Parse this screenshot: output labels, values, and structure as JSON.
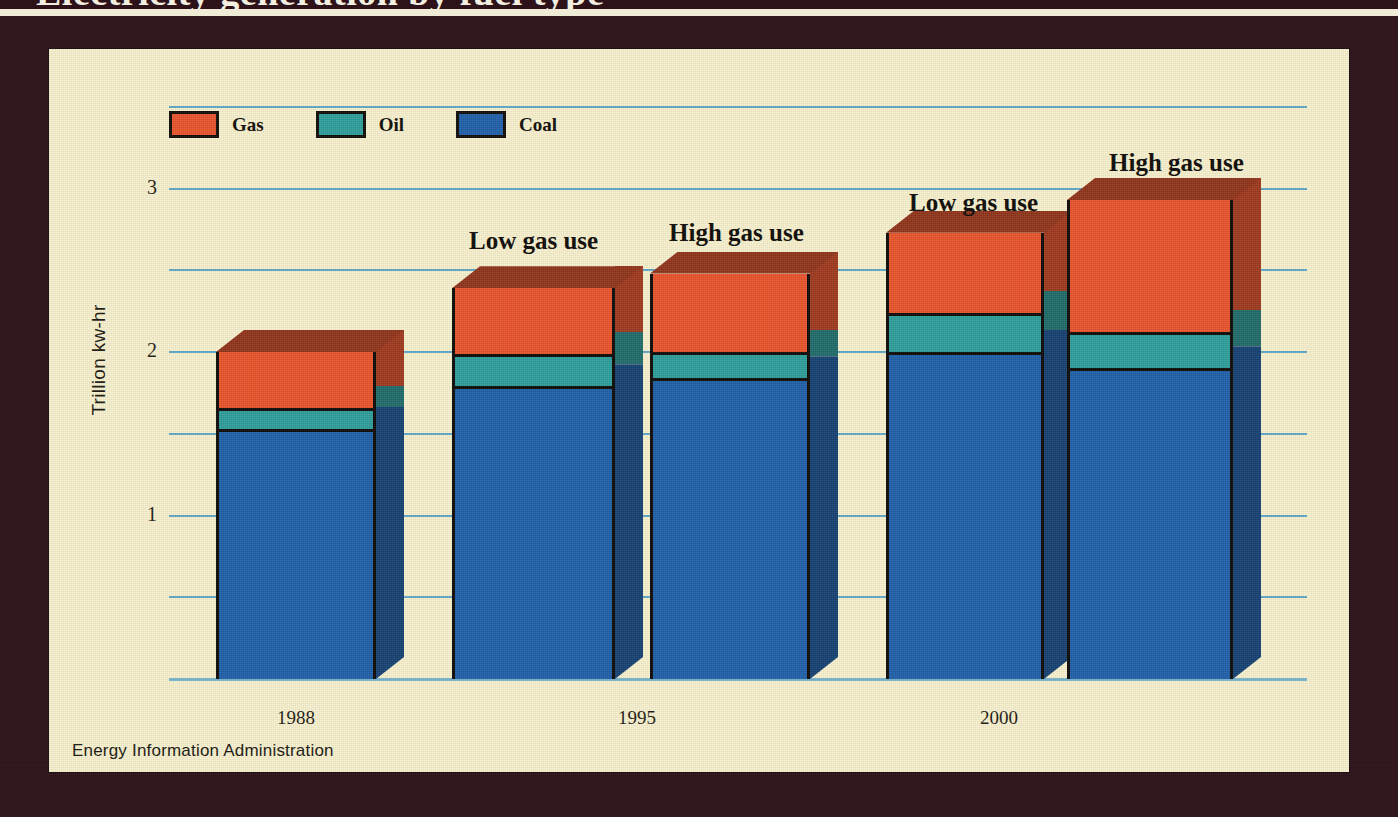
{
  "poster": {
    "title": "Electricity generation by fuel type",
    "frame_color": "#2e1219",
    "panel_color": "#f7f1cd"
  },
  "legend": {
    "items": [
      {
        "label": "Gas",
        "color": "#e8542c"
      },
      {
        "label": "Oil",
        "color": "#2e9e9a"
      },
      {
        "label": "Coal",
        "color": "#1f5fa8"
      }
    ]
  },
  "axes": {
    "ylabel": "Trillion kw-hr",
    "yticks": [
      "3",
      "2",
      "1"
    ],
    "ytick_values": [
      3,
      2,
      1
    ],
    "gridline_values": [
      3.5,
      3,
      2.5,
      2,
      1.5,
      1,
      0.5,
      0
    ],
    "xticks": [
      "1988",
      "1995",
      "2000"
    ]
  },
  "annotations": {
    "low_gas": "Low gas use",
    "high_gas": "High gas use"
  },
  "source": "Energy Information Administration",
  "chart_data": {
    "type": "bar",
    "title": "Electricity generation by fuel type",
    "subtitle": "",
    "stacked": true,
    "xlabel": "",
    "ylabel": "Trillion kw-hr",
    "ylim": [
      0,
      3.5
    ],
    "yticks": [
      1,
      2,
      3
    ],
    "grid": true,
    "legend_position": "top-left",
    "categories": [
      "1988",
      "1995 Low gas use",
      "1995 High gas use",
      "2000 Low gas use",
      "2000 High gas use"
    ],
    "groups": [
      {
        "year": "1988",
        "scenario": ""
      },
      {
        "year": "1995",
        "scenario": "Low gas use"
      },
      {
        "year": "1995",
        "scenario": "High gas use"
      },
      {
        "year": "2000",
        "scenario": "Low gas use"
      },
      {
        "year": "2000",
        "scenario": "High gas use"
      }
    ],
    "series": [
      {
        "name": "Coal",
        "color": "#1f5fa8",
        "values": [
          1.53,
          1.79,
          1.84,
          2.0,
          1.9
        ]
      },
      {
        "name": "Oil",
        "color": "#2e9e9a",
        "values": [
          0.13,
          0.2,
          0.16,
          0.24,
          0.22
        ]
      },
      {
        "name": "Gas",
        "color": "#e8542c",
        "values": [
          0.34,
          0.4,
          0.48,
          0.49,
          0.81
        ]
      }
    ],
    "totals": [
      2.0,
      2.39,
      2.48,
      2.73,
      2.93
    ]
  },
  "layout": {
    "bars": [
      {
        "x": 167,
        "width": 160,
        "group": 0
      },
      {
        "x": 403,
        "width": 163,
        "group": 1
      },
      {
        "x": 601,
        "width": 160,
        "group": 2
      },
      {
        "x": 837,
        "width": 158,
        "group": 3
      },
      {
        "x": 1018,
        "width": 166,
        "group": 4
      }
    ],
    "depth_x": 28,
    "depth_y": 22,
    "baseline_y": 630,
    "unit_px": 163.5,
    "plot_left": 120,
    "plot_right": 1258,
    "gridline_left": [
      70,
      70,
      70,
      70,
      70,
      70,
      70,
      70
    ],
    "year_label_positions": [
      247,
      588,
      950
    ],
    "scenario_positions": [
      {
        "key": "low_gas",
        "x": 420,
        "y": 178
      },
      {
        "key": "high_gas",
        "x": 620,
        "y": 170
      },
      {
        "key": "low_gas",
        "x": 860,
        "y": 140
      },
      {
        "key": "high_gas",
        "x": 1060,
        "y": 100
      }
    ]
  }
}
